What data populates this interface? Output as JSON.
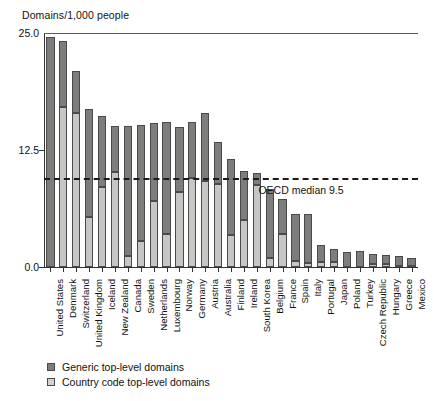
{
  "chart_data": {
    "type": "bar",
    "stacked": true,
    "title": "",
    "ylabel": "Domains/1,000 people",
    "xlabel": "",
    "ylim": [
      0.0,
      25.0
    ],
    "yticks": [
      "0.0",
      "12.5",
      "25.0"
    ],
    "ytick_values": [
      0.0,
      12.5,
      25.0
    ],
    "grid": false,
    "legend_position": "below-plot",
    "categories": [
      "United States",
      "Denmark",
      "Switzerland",
      "United Kingdom",
      "Iceland",
      "New Zealand",
      "Canada",
      "Sweden",
      "Netherlands",
      "Luxembourg",
      "Norway",
      "Germany",
      "Austria",
      "Australia",
      "Finland",
      "Ireland",
      "South Korea",
      "Belgium",
      "France",
      "Spain",
      "Italy",
      "Portugal",
      "Japan",
      "Poland",
      "Turkey",
      "Czech Republic",
      "Hungary",
      "Greece",
      "Mexico"
    ],
    "series": [
      {
        "name": "Generic top-level domains",
        "color": "#7d7d7b",
        "values": [
          24.6,
          7.0,
          4.4,
          11.6,
          7.5,
          5.0,
          13.9,
          12.4,
          8.4,
          12.0,
          7.0,
          6.0,
          7.3,
          4.5,
          8.1,
          5.3,
          1.2,
          7.3,
          3.8,
          5.1,
          5.3,
          1.8,
          1.4,
          1.6,
          1.7,
          1.1,
          1.0,
          1.1,
          0.9
        ]
      },
      {
        "name": "Country code top-level domains",
        "color": "#d2d2d0",
        "values": [
          0.0,
          17.1,
          16.5,
          5.3,
          8.6,
          10.1,
          1.2,
          2.8,
          7.0,
          3.5,
          8.0,
          9.5,
          9.2,
          8.9,
          3.4,
          5.0,
          8.8,
          1.0,
          3.5,
          0.6,
          0.4,
          0.5,
          0.5,
          0.0,
          0.0,
          0.3,
          0.3,
          0.1,
          0.1
        ]
      }
    ],
    "totals": [
      24.6,
      24.1,
      20.9,
      16.9,
      16.1,
      15.1,
      15.1,
      15.2,
      15.4,
      15.5,
      15.0,
      15.5,
      16.5,
      13.4,
      11.5,
      10.3,
      10.0,
      8.3,
      7.3,
      5.7,
      5.7,
      2.3,
      1.9,
      1.6,
      1.7,
      1.4,
      1.3,
      1.2,
      1.0
    ],
    "reference_line": {
      "label": "OECD median 9.5",
      "value": 9.5,
      "style": "dashed"
    }
  },
  "legend": {
    "items": [
      {
        "label": "Generic top-level domains"
      },
      {
        "label": "Country code top-level domains"
      }
    ]
  },
  "colors": {
    "gtld": "#7d7d7b",
    "cctld": "#d2d2d0",
    "axis": "#333333",
    "text": "#111111"
  }
}
